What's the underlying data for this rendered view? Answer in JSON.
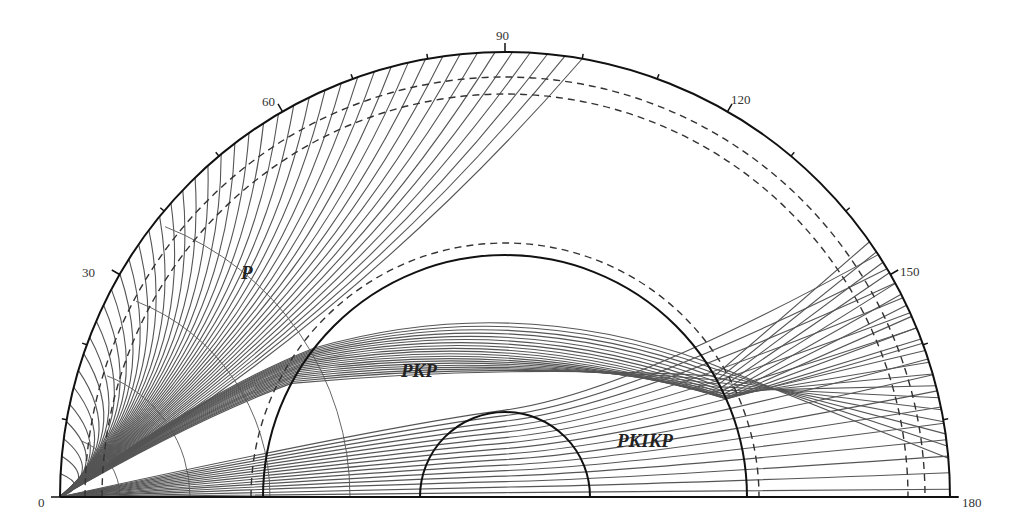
{
  "diagram": {
    "type": "seismic-ray-path-half-earth",
    "geometry": {
      "center_x": 505,
      "center_y": 497,
      "earth_radius_px": 445,
      "outer_core_radius_px": 242,
      "inner_core_radius_px": 85,
      "dashed_radii_px": [
        420,
        403,
        254
      ]
    },
    "angle_axis": {
      "label_ticks": [
        {
          "deg": 0,
          "text": "0",
          "x": 38,
          "y": 507
        },
        {
          "deg": 30,
          "text": "30",
          "x": 82,
          "y": 277
        },
        {
          "deg": 60,
          "text": "60",
          "x": 262,
          "y": 106
        },
        {
          "deg": 90,
          "text": "90",
          "x": 496,
          "y": 40
        },
        {
          "deg": 120,
          "text": "120",
          "x": 731,
          "y": 104
        },
        {
          "deg": 150,
          "text": "150",
          "x": 900,
          "y": 276
        },
        {
          "deg": 180,
          "text": "180",
          "x": 962,
          "y": 507
        }
      ],
      "minor_tick_step_deg": 10
    },
    "phases": [
      {
        "name": "P",
        "text": "P",
        "x": 241,
        "y": 279
      },
      {
        "name": "PKP",
        "text": "PKP",
        "x": 401,
        "y": 377
      },
      {
        "name": "PKIKP",
        "text": "PKIKP",
        "x": 617,
        "y": 447
      }
    ],
    "ray_families": {
      "P_count": 44,
      "PKP_count": 20,
      "PKIKP_count": 16
    }
  }
}
